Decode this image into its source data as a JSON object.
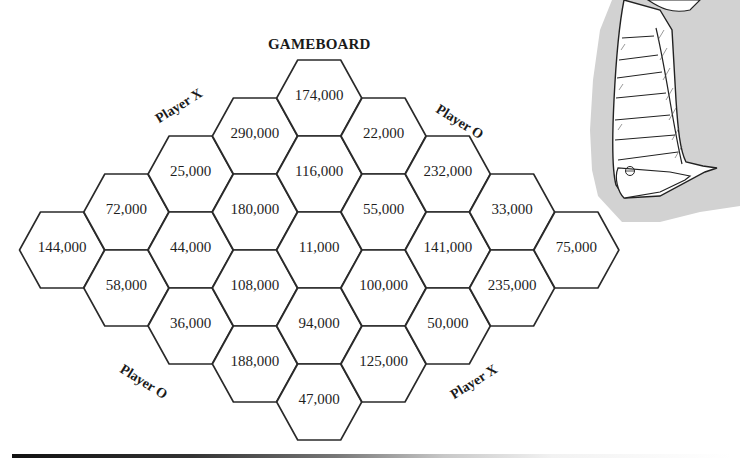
{
  "title": "GAMEBOARD",
  "player_labels": [
    {
      "text": "Player X",
      "position": "top-left"
    },
    {
      "text": "Player O",
      "position": "top-right"
    },
    {
      "text": "Player O",
      "position": "bottom-left"
    },
    {
      "text": "Player X",
      "position": "bottom-right"
    }
  ],
  "cells": [
    {
      "value": "144,000",
      "col": 0,
      "row": 0
    },
    {
      "value": "72,000",
      "col": 1,
      "row": -0.5
    },
    {
      "value": "58,000",
      "col": 1,
      "row": 0.5
    },
    {
      "value": "25,000",
      "col": 2,
      "row": -1
    },
    {
      "value": "44,000",
      "col": 2,
      "row": 0
    },
    {
      "value": "36,000",
      "col": 2,
      "row": 1
    },
    {
      "value": "290,000",
      "col": 3,
      "row": -1.5
    },
    {
      "value": "180,000",
      "col": 3,
      "row": -0.5
    },
    {
      "value": "108,000",
      "col": 3,
      "row": 0.5
    },
    {
      "value": "188,000",
      "col": 3,
      "row": 1.5
    },
    {
      "value": "174,000",
      "col": 4,
      "row": -2
    },
    {
      "value": "116,000",
      "col": 4,
      "row": -1
    },
    {
      "value": "11,000",
      "col": 4,
      "row": 0
    },
    {
      "value": "94,000",
      "col": 4,
      "row": 1
    },
    {
      "value": "47,000",
      "col": 4,
      "row": 2
    },
    {
      "value": "22,000",
      "col": 5,
      "row": -1.5
    },
    {
      "value": "55,000",
      "col": 5,
      "row": -0.5
    },
    {
      "value": "100,000",
      "col": 5,
      "row": 0.5
    },
    {
      "value": "125,000",
      "col": 5,
      "row": 1.5
    },
    {
      "value": "232,000",
      "col": 6,
      "row": -1
    },
    {
      "value": "141,000",
      "col": 6,
      "row": 0
    },
    {
      "value": "50,000",
      "col": 6,
      "row": 1
    },
    {
      "value": "33,000",
      "col": 7,
      "row": -0.5
    },
    {
      "value": "235,000",
      "col": 7,
      "row": 0.5
    },
    {
      "value": "75,000",
      "col": 8,
      "row": 0
    }
  ],
  "illustration": {
    "description": "striped-leg-with-shoe-cartoon",
    "shadow_color": "#cfcfcf"
  },
  "colors": {
    "line": "#2a2a2a",
    "text": "#1e1e1e",
    "background": "#ffffff"
  }
}
